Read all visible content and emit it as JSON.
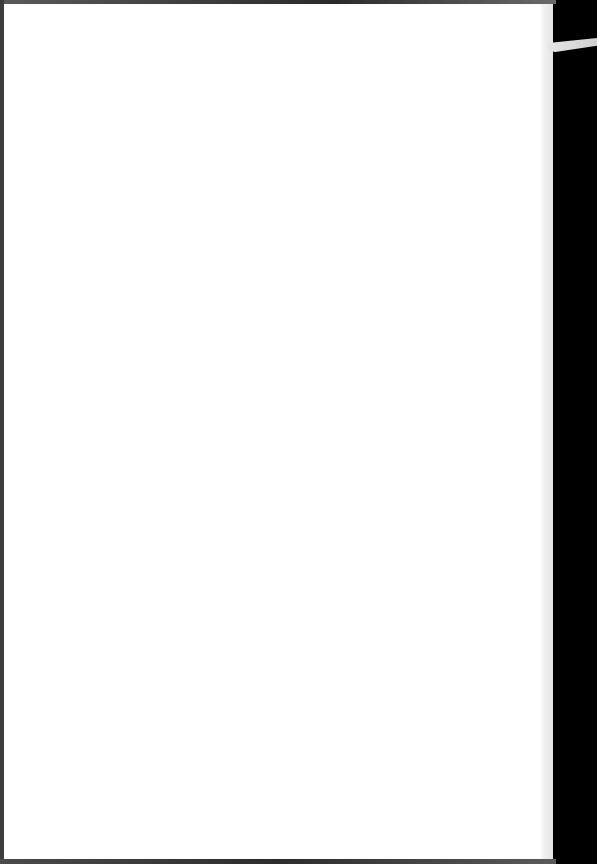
{
  "page": {
    "type": "blank-paper-sheet",
    "text_content": [],
    "colors": {
      "paper": "#ffffff",
      "background": "#000000",
      "edge_shadow": "#3c3c3c"
    }
  }
}
